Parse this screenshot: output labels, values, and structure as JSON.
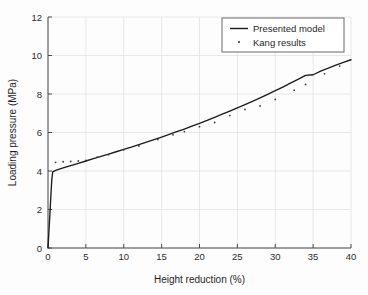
{
  "chart_data": {
    "type": "line",
    "title": "",
    "xlabel": "Height reduction (%)",
    "ylabel": "Loading pressure (MPa)",
    "xlim": [
      0,
      40
    ],
    "ylim": [
      0,
      12
    ],
    "xticks": [
      0,
      5,
      10,
      15,
      20,
      25,
      30,
      35,
      40
    ],
    "yticks": [
      0,
      2,
      4,
      6,
      8,
      10,
      12
    ],
    "xtick_labels": [
      "0",
      "5",
      "10",
      "15",
      "20",
      "25",
      "30",
      "35",
      "40"
    ],
    "ytick_labels": [
      "0",
      "2",
      "4",
      "6",
      "8",
      "10",
      "12"
    ],
    "grid": true,
    "legend_position": "top-right",
    "series": [
      {
        "name": "Presented model",
        "style": "solid-line",
        "color": "#1b1b1b",
        "x": [
          0.0,
          0.12,
          0.25,
          0.38,
          0.5,
          0.62,
          1.0,
          2.0,
          3.0,
          4.0,
          5.0,
          6.0,
          7.0,
          8.0,
          9.0,
          10.0,
          11.0,
          12.0,
          13.0,
          14.0,
          15.0,
          16.0,
          17.0,
          18.0,
          19.0,
          20.0,
          21.0,
          22.0,
          23.0,
          24.0,
          25.0,
          26.0,
          27.0,
          28.0,
          29.0,
          30.0,
          31.0,
          32.0,
          33.0,
          34.0,
          35.0,
          36.0,
          37.0,
          38.0,
          39.0,
          40.0
        ],
        "y": [
          0.0,
          0.85,
          1.75,
          2.7,
          3.55,
          3.95,
          4.03,
          4.16,
          4.28,
          4.4,
          4.52,
          4.64,
          4.76,
          4.88,
          5.0,
          5.12,
          5.24,
          5.37,
          5.5,
          5.63,
          5.76,
          5.9,
          6.04,
          6.18,
          6.33,
          6.48,
          6.63,
          6.79,
          6.95,
          7.11,
          7.28,
          7.45,
          7.62,
          7.8,
          7.98,
          8.17,
          8.36,
          8.56,
          8.76,
          8.97,
          9.0,
          9.19,
          9.34,
          9.5,
          9.64,
          9.78
        ]
      },
      {
        "name": "Kang results",
        "style": "dotted-markers",
        "color": "#3a3a3a",
        "x": [
          1.0,
          2.0,
          3.0,
          4.0,
          5.0,
          6.5,
          8.0,
          10.0,
          12.0,
          14.5,
          16.5,
          18.0,
          20.0,
          22.0,
          24.0,
          26.0,
          28.0,
          30.0,
          32.5,
          34.0,
          36.5,
          38.5
        ],
        "y": [
          4.45,
          4.48,
          4.5,
          4.52,
          4.55,
          4.72,
          4.85,
          5.1,
          5.3,
          5.63,
          5.88,
          6.05,
          6.3,
          6.52,
          6.88,
          7.2,
          7.38,
          7.72,
          8.2,
          8.5,
          9.05,
          9.45
        ]
      }
    ]
  },
  "legend": {
    "entries": [
      {
        "label": "Presented model",
        "marker": "line"
      },
      {
        "label": "Kang results",
        "marker": "dot"
      }
    ]
  }
}
